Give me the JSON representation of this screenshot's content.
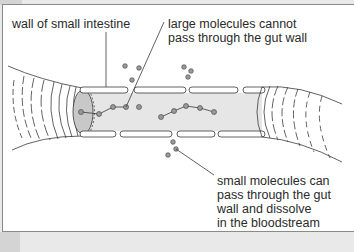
{
  "diagram": {
    "labels": {
      "wall": {
        "text": "wall of small intestine"
      },
      "large_molecules": {
        "lines": [
          "large molecules cannot",
          "pass through the gut wall"
        ]
      },
      "small_molecules": {
        "lines": [
          "small molecules can",
          "pass through the gut",
          "wall and dissolve",
          "in the bloodstream"
        ]
      }
    },
    "colors": {
      "background": "#ffffff",
      "lumen": "#e6e6e6",
      "end_cap": "#c8c8c8",
      "molecule_fill": "#9a9a9a",
      "stroke": "#3a3a3a",
      "outer_bg": "#e9e9e9"
    },
    "elements": {
      "large_molecule_chains": 2,
      "small_molecules_outside_top": 5,
      "small_molecules_outside_bottom": 3,
      "small_molecules_inside": 1
    }
  }
}
